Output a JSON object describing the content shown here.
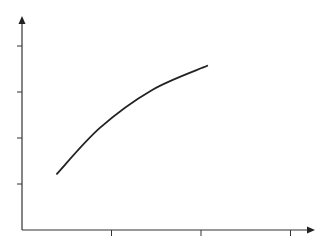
{
  "chart_data": {
    "type": "line",
    "title": "",
    "xlabel": "",
    "ylabel": "",
    "x_ticks": [
      1,
      2,
      3
    ],
    "y_ticks": [
      1,
      2,
      3,
      4
    ],
    "tick_labels_visible": false,
    "xlim": [
      0,
      3.2
    ],
    "ylim": [
      0,
      4.6
    ],
    "grid": false,
    "legend": null,
    "series": [
      {
        "name": "curve",
        "x": [
          0.39,
          0.87,
          1.45,
          2.07
        ],
        "y": [
          1.22,
          2.22,
          3.04,
          3.57
        ]
      }
    ],
    "colors": {
      "axis": "#333333",
      "line": "#222222"
    }
  }
}
